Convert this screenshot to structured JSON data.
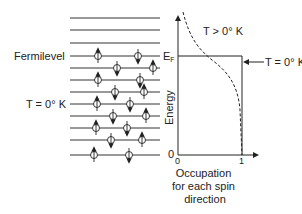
{
  "left_panel": {
    "fermi_label": "Fermilevel",
    "temp_label": "T = 0° K",
    "levels_y": [
      18,
      30,
      43,
      56,
      68,
      80,
      92,
      104,
      116,
      128,
      140,
      155
    ],
    "level_x_start": 70,
    "level_x_end": 160,
    "electrons": [
      {
        "x": 98,
        "y": 56,
        "spin": "up"
      },
      {
        "x": 138,
        "y": 56,
        "spin": "down"
      },
      {
        "x": 117,
        "y": 68,
        "spin": "down"
      },
      {
        "x": 153,
        "y": 68,
        "spin": "up"
      },
      {
        "x": 98,
        "y": 80,
        "spin": "up"
      },
      {
        "x": 140,
        "y": 80,
        "spin": "down"
      },
      {
        "x": 115,
        "y": 92,
        "spin": "down"
      },
      {
        "x": 144,
        "y": 92,
        "spin": "up"
      },
      {
        "x": 97,
        "y": 104,
        "spin": "up"
      },
      {
        "x": 130,
        "y": 104,
        "spin": "down"
      },
      {
        "x": 113,
        "y": 116,
        "spin": "down"
      },
      {
        "x": 146,
        "y": 116,
        "spin": "up"
      },
      {
        "x": 96,
        "y": 128,
        "spin": "up"
      },
      {
        "x": 127,
        "y": 128,
        "spin": "down"
      },
      {
        "x": 111,
        "y": 140,
        "spin": "down"
      },
      {
        "x": 142,
        "y": 140,
        "spin": "up"
      },
      {
        "x": 94,
        "y": 155,
        "spin": "up"
      },
      {
        "x": 129,
        "y": 155,
        "spin": "down"
      }
    ]
  },
  "right_panel": {
    "y_axis_label": "Energy",
    "fermi_tick_label": "E",
    "fermi_tick_sub": "F",
    "origin_y_label": "0",
    "x_tick_0": "0",
    "x_tick_1": "1",
    "x_axis_label_lines": [
      "Occupation",
      "for each spin",
      "direction"
    ],
    "curve_hot_label": "T > 0° K",
    "curve_cold_label": "T = 0° K"
  }
}
